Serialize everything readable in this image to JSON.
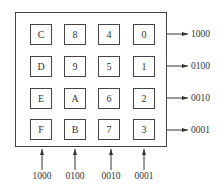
{
  "keypad": {
    "rows": [
      [
        "C",
        "8",
        "4",
        "0"
      ],
      [
        "D",
        "9",
        "5",
        "1"
      ],
      [
        "E",
        "A",
        "6",
        "2"
      ],
      [
        "F",
        "B",
        "7",
        "3"
      ]
    ]
  },
  "row_outputs": [
    "1000",
    "0100",
    "0010",
    "0001"
  ],
  "column_inputs": [
    "1000",
    "0100",
    "0010",
    "0001"
  ]
}
